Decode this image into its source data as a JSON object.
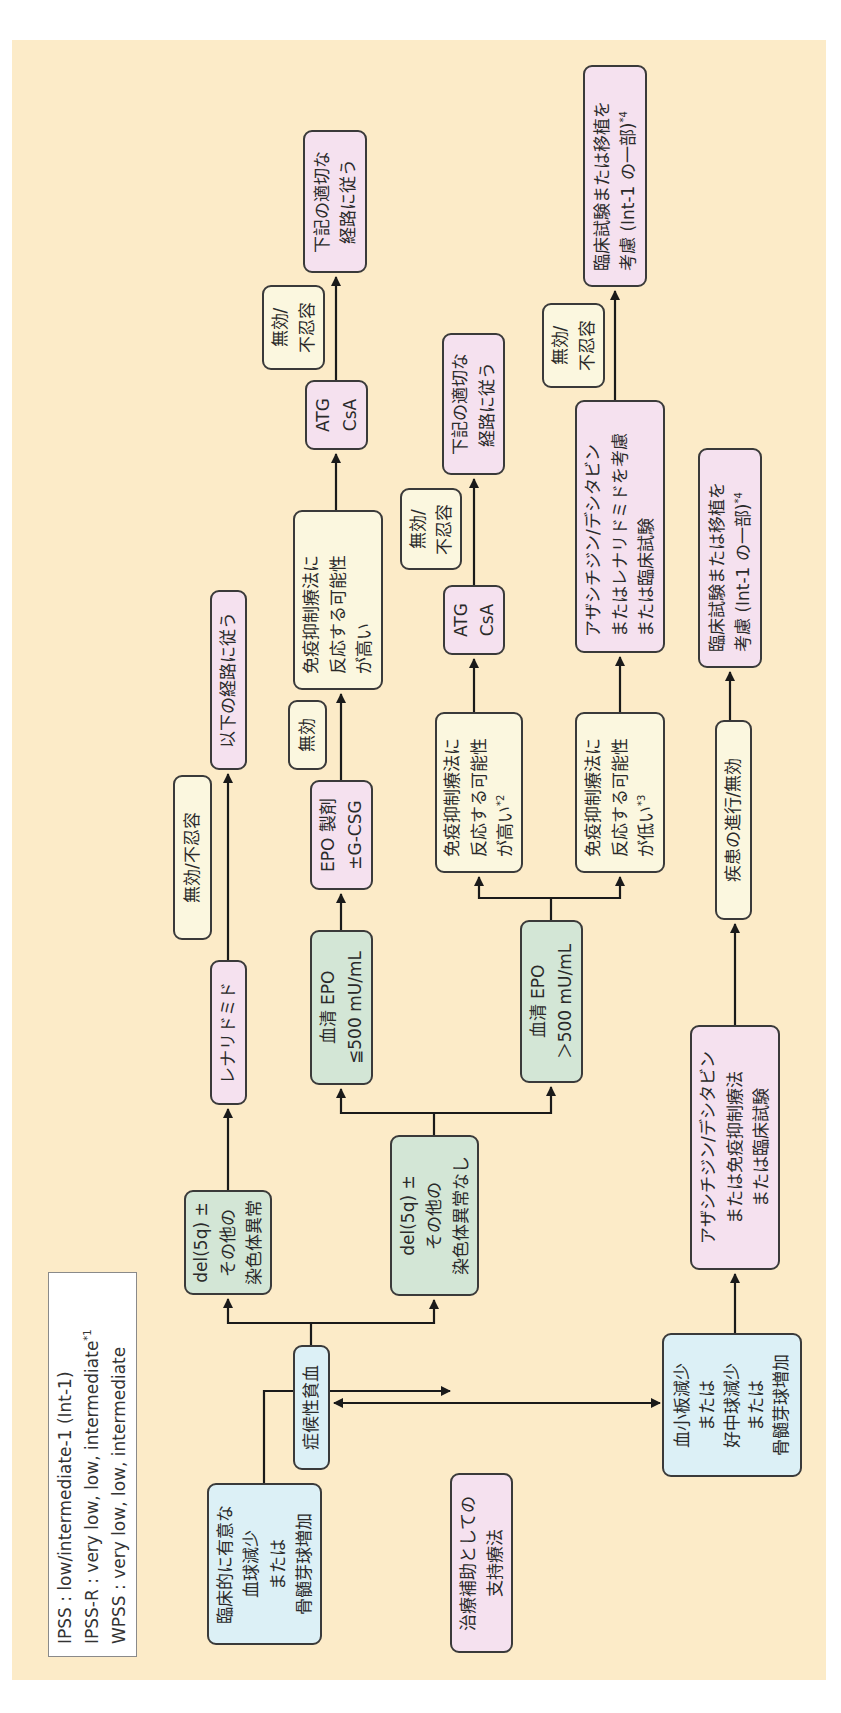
{
  "colors": {
    "background": "#fcebc8",
    "entry_box": "#dcf0f6",
    "cytogenetic_box": "#d3e6d6",
    "treatment_box": "#f5e1ef",
    "outcome_box": "#fbf7df",
    "line": "#1a1a1a"
  },
  "legend": {
    "line1": "IPSS : low/intermediate-1 (Int-1)",
    "line2": "IPSS-R : very low, low, intermediate",
    "line2_note": "*1",
    "line3": "WPSS : very low, low, intermediate"
  },
  "nodes": {
    "cytopenia_entry": [
      "臨床的に有意な",
      "血球減少",
      "または",
      "骨髄芽球増加"
    ],
    "supportive_care": [
      "治療補助としての",
      "支持療法"
    ],
    "symptomatic_anemia": [
      "症候性貧血"
    ],
    "thrombocytopenia": [
      "血小板減少",
      "または",
      "好中球減少",
      "または",
      "骨髄芽球増加"
    ],
    "del5q_with": [
      "del(5q) ±",
      "その他の",
      "染色体異常"
    ],
    "del5q_without": [
      "del(5q) ±",
      "その他の",
      "染色体異常なし"
    ],
    "lenalidomide": [
      "レナリドミド"
    ],
    "lenalidomide_fail": [
      "無効/不忍容"
    ],
    "follow_path_below": [
      "以下の経路に従う"
    ],
    "epo_low": [
      "血清 EPO",
      "≦500 mU/mL"
    ],
    "epo_agent": [
      "EPO 製剤",
      "±G-CSG"
    ],
    "epo_agent_fail": [
      "無効"
    ],
    "ist_likely_top": [
      "免疫抑制療法に",
      "反応する可能性",
      "が高い"
    ],
    "atg_csa_top": [
      "ATG",
      "CsA"
    ],
    "atg_fail_top": [
      "無効/",
      "不忍容"
    ],
    "follow_path_top": [
      "下記の適切な",
      "経路に従う"
    ],
    "epo_high": [
      "血清 EPO",
      "＞500 mU/mL"
    ],
    "ist_likely_mid": [
      "免疫抑制療法に",
      "反応する可能性",
      "が高い"
    ],
    "ist_likely_mid_note": "*2",
    "ist_unlikely": [
      "免疫抑制療法に",
      "反応する可能性",
      "が低い"
    ],
    "ist_unlikely_note": "*3",
    "atg_csa_mid": [
      "ATG",
      "CsA"
    ],
    "atg_fail_mid": [
      "無効/",
      "不忍容"
    ],
    "follow_path_mid": [
      "下記の適切な",
      "経路に従う"
    ],
    "aza_lenalidomide": [
      "アザシチジン/デシタビン",
      "またはレナリドミドを考慮",
      "または臨床試験"
    ],
    "aza_fail": [
      "無効/",
      "不忍容"
    ],
    "trial_top": [
      "臨床試験または移植を",
      "考慮 (Int-1 の一部)"
    ],
    "trial_top_note": "*4",
    "aza_ist": [
      "アザシチジン/デシタビン",
      "または免疫抑制療法",
      "または臨床試験"
    ],
    "progression": [
      "疾患の進行/無効"
    ],
    "trial_bottom": [
      "臨床試験または移植を",
      "考慮 (Int-1 の一部)"
    ],
    "trial_bottom_note": "*4"
  }
}
